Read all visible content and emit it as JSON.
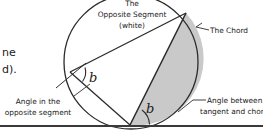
{
  "figure": {
    "colors": {
      "background": "#ffffff",
      "ink": "#2b2b2b",
      "shaded_segment": "#c9c9c9",
      "white_segment": "#ffffff"
    },
    "circle": {
      "cx": 131,
      "cy": 62,
      "r": 67
    },
    "points": {
      "left_vertex": {
        "x": 70,
        "y": 72
      },
      "top_right_vertex": {
        "x": 186,
        "y": 13
      },
      "tangent_point": {
        "x": 130,
        "y": 125
      }
    },
    "tangent_line": {
      "y": 126,
      "x1": 0,
      "x2": 263
    }
  },
  "labels": {
    "opposite_segment_line1": "The",
    "opposite_segment_line2": "Opposite Segment",
    "opposite_segment_line3": "(white)",
    "chord": "The Chord",
    "angle_opposite_line1": "Angle in the",
    "angle_opposite_line2": "opposite segment",
    "angle_tangent_line1": "Angle between",
    "angle_tangent_line2": "tangent and chord",
    "angle_mark_upper": "b",
    "angle_mark_lower": "b"
  },
  "cropped_text": {
    "line1": "ne",
    "line2": "d)."
  }
}
